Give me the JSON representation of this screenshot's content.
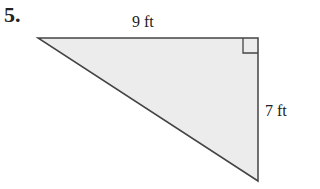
{
  "problem": {
    "number": "5."
  },
  "figure": {
    "type": "right-triangle",
    "fill_color": "#ececec",
    "stroke_color": "#444444",
    "top_side_label": "9 ft",
    "right_side_label": "7 ft",
    "right_angle_marker": true
  }
}
